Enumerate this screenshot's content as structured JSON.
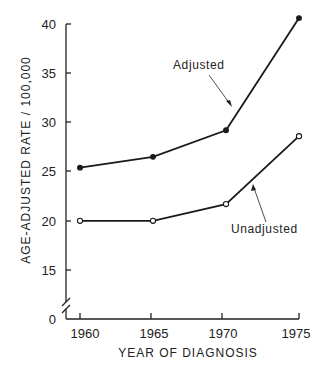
{
  "chart_data": {
    "type": "line",
    "title": "",
    "xlabel": "YEAR OF DIAGNOSIS",
    "ylabel": "AGE-ADJUSTED RATE / 100,000",
    "x": [
      1960,
      1965,
      1970,
      1975
    ],
    "x_tick_labels": [
      "1960",
      "1965",
      "1970",
      "1975"
    ],
    "y_tick_labels": [
      "0",
      "15",
      "20",
      "25",
      "30",
      "35",
      "40"
    ],
    "y_ticks": [
      0,
      15,
      20,
      25,
      30,
      35,
      40
    ],
    "ylim": [
      0,
      40
    ],
    "y_axis_break": "between 0 and 15",
    "grid": false,
    "legend": "none (direct annotations with arrows)",
    "series": [
      {
        "name": "Adjusted",
        "marker": "filled-circle",
        "values": [
          25.4,
          26.5,
          29.2,
          40.6
        ]
      },
      {
        "name": "Unadjusted",
        "marker": "open-circle",
        "values": [
          20.0,
          20.0,
          21.7,
          28.6
        ]
      }
    ],
    "annotations": [
      {
        "text": "Adjusted",
        "points_to": "Adjusted series between 1970 and 1975"
      },
      {
        "text": "Unadjusted",
        "points_to": "Unadjusted series between 1970 and 1975"
      }
    ]
  }
}
